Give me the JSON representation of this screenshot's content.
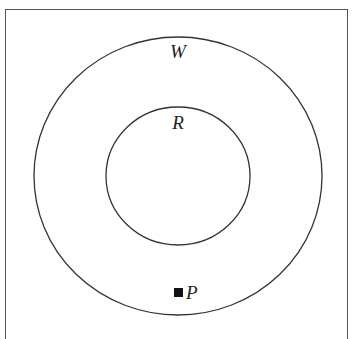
{
  "diagram": {
    "type": "venn-nested-sets",
    "frame": {
      "stroke": "#555555"
    },
    "sets": [
      {
        "id": "W",
        "label": "W",
        "cx": 178,
        "cy": 176,
        "rx": 144,
        "ry": 139,
        "stroke": "#333333"
      },
      {
        "id": "R",
        "label": "R",
        "cx": 178,
        "cy": 176,
        "rx": 72,
        "ry": 69,
        "stroke": "#333333"
      }
    ],
    "points": [
      {
        "id": "P",
        "label": "P",
        "x": 179,
        "y": 293,
        "marker": "filled-square",
        "color": "#111111"
      }
    ],
    "relationships": [
      "R is a subset of W",
      "P is in W but not in R"
    ]
  },
  "labels": {
    "outer_set": "W",
    "inner_set": "R",
    "point": "P"
  }
}
